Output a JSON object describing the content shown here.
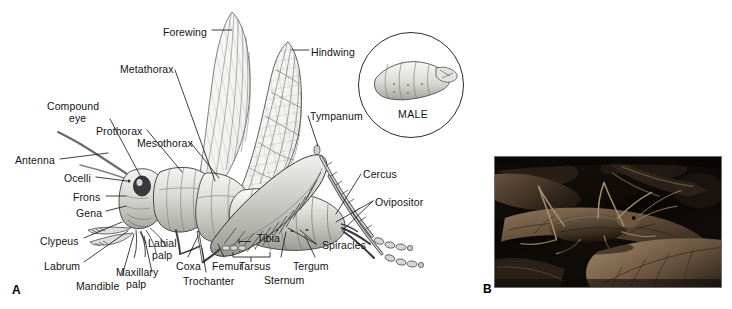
{
  "figure": {
    "background": "#ffffff",
    "ink": "#141414",
    "panels": [
      {
        "id": "A",
        "type": "line-drawing",
        "subject": "katydid external anatomy, lateral view, female"
      },
      {
        "id": "B",
        "type": "photograph",
        "subject": "katydid resting on dead leaves"
      }
    ]
  },
  "panel_a": {
    "panel_letter": "A",
    "labels": [
      {
        "key": "forewing",
        "text": "Forewing",
        "x": 163,
        "y": 27,
        "align": "left"
      },
      {
        "key": "hindwing",
        "text": "Hindwing",
        "x": 311,
        "y": 47,
        "align": "left"
      },
      {
        "key": "metathorax",
        "text": "Metathorax",
        "x": 120,
        "y": 64,
        "align": "left"
      },
      {
        "key": "compound",
        "text": "Compound",
        "x": 47,
        "y": 101,
        "align": "left"
      },
      {
        "key": "eye",
        "text": "eye",
        "x": 69,
        "y": 113,
        "align": "left"
      },
      {
        "key": "prothorax",
        "text": "Prothorax",
        "x": 96,
        "y": 126,
        "align": "left"
      },
      {
        "key": "mesothorax",
        "text": "Mesothorax",
        "x": 137,
        "y": 138,
        "align": "left"
      },
      {
        "key": "tympanum",
        "text": "Tympanum",
        "x": 310,
        "y": 111,
        "align": "left"
      },
      {
        "key": "antenna",
        "text": "Antenna",
        "x": 15,
        "y": 155,
        "align": "left"
      },
      {
        "key": "ocelli",
        "text": "Ocelli",
        "x": 64,
        "y": 173,
        "align": "left"
      },
      {
        "key": "frons",
        "text": "Frons",
        "x": 73,
        "y": 192,
        "align": "left"
      },
      {
        "key": "gena",
        "text": "Gena",
        "x": 76,
        "y": 208,
        "align": "left"
      },
      {
        "key": "cercus",
        "text": "Cercus",
        "x": 363,
        "y": 169,
        "align": "left"
      },
      {
        "key": "ovipositor",
        "text": "Ovipositor",
        "x": 375,
        "y": 197,
        "align": "left"
      },
      {
        "key": "clypeus",
        "text": "Clypeus",
        "x": 40,
        "y": 236,
        "align": "left"
      },
      {
        "key": "labrum",
        "text": "Labrum",
        "x": 44,
        "y": 261,
        "align": "left"
      },
      {
        "key": "labial",
        "text": "Labial",
        "x": 148,
        "y": 238,
        "align": "left"
      },
      {
        "key": "palp1",
        "text": "palp",
        "x": 152,
        "y": 250,
        "align": "left"
      },
      {
        "key": "mandible",
        "text": "Mandible",
        "x": 76,
        "y": 281,
        "align": "left"
      },
      {
        "key": "maxillary",
        "text": "Maxillary",
        "x": 116,
        "y": 267,
        "align": "left"
      },
      {
        "key": "palp2",
        "text": "palp",
        "x": 126,
        "y": 279,
        "align": "left"
      },
      {
        "key": "coxa",
        "text": "Coxa",
        "x": 176,
        "y": 261,
        "align": "left"
      },
      {
        "key": "trochanter",
        "text": "Trochanter",
        "x": 183,
        "y": 276,
        "align": "left"
      },
      {
        "key": "femur",
        "text": "Femur",
        "x": 212,
        "y": 261,
        "align": "left"
      },
      {
        "key": "tibia",
        "text": "Tibia",
        "x": 257,
        "y": 233,
        "align": "left"
      },
      {
        "key": "tarsus",
        "text": "Tarsus",
        "x": 239,
        "y": 261,
        "align": "left"
      },
      {
        "key": "sternum",
        "text": "Sternum",
        "x": 264,
        "y": 275,
        "align": "left"
      },
      {
        "key": "tergum",
        "text": "Tergum",
        "x": 293,
        "y": 261,
        "align": "left"
      },
      {
        "key": "spiracles",
        "text": "Spiracles",
        "x": 322,
        "y": 240,
        "align": "left"
      }
    ],
    "inset": {
      "label": "MALE",
      "shape": "circle",
      "subject": "male abdomen tip"
    }
  },
  "panel_b": {
    "panel_letter": "B",
    "caption": "",
    "photo": {
      "subject": "katydid on dead leaves",
      "palette": [
        "#0b0907",
        "#2a211a",
        "#554437",
        "#8a7158",
        "#b09madd"
      ],
      "tone": "dark-sepia-monochrome"
    }
  }
}
